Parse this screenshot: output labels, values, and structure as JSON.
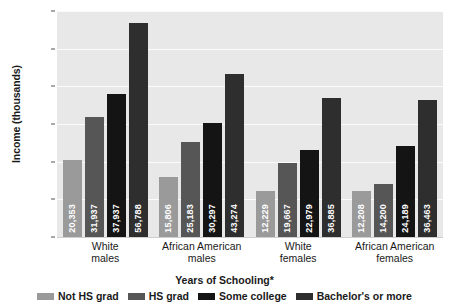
{
  "chart_data": {
    "type": "bar",
    "title": "",
    "xlabel": "Years of Schooling*",
    "ylabel": "Income (thousands)",
    "ylim": [
      0,
      60000
    ],
    "grid": true,
    "legend_position": "bottom",
    "categories": [
      "White\nmales",
      "African American\nmales",
      "White\nfemales",
      "African American\nfemales"
    ],
    "category_lines": [
      [
        "White",
        "males"
      ],
      [
        "African American",
        "males"
      ],
      [
        "White",
        "females"
      ],
      [
        "African American",
        "females"
      ]
    ],
    "ytick_labels": [
      "$60",
      "$50",
      "$40",
      "$30",
      "$20",
      "$10",
      "$0"
    ],
    "ytick_values": [
      60000,
      50000,
      40000,
      30000,
      20000,
      10000,
      0
    ],
    "series": [
      {
        "name": "Not HS grad",
        "color": "#9a9a9a",
        "values": [
          20353,
          15806,
          12229,
          12208
        ],
        "labels": [
          "20,353",
          "15,806",
          "12,229",
          "12,208"
        ]
      },
      {
        "name": "HS grad",
        "color": "#565656",
        "values": [
          31937,
          25183,
          19667,
          14200
        ],
        "labels": [
          "31,937",
          "25,183",
          "19,667",
          "14,200"
        ]
      },
      {
        "name": "Some college",
        "color": "#141414",
        "values": [
          37937,
          30297,
          22979,
          24189
        ],
        "labels": [
          "37,937",
          "30,297",
          "22,979",
          "24,189"
        ]
      },
      {
        "name": "Bachelor's or more",
        "color": "#2e2e2e",
        "values": [
          56788,
          43274,
          36885,
          36463
        ],
        "labels": [
          "56,788",
          "43,274",
          "36,885",
          "36,463"
        ]
      }
    ]
  },
  "colors": {
    "plot_background": "#e8e8e8",
    "gridline": "#fbfbfb",
    "page_background": "#ffffff",
    "text": "#1a1a1a"
  }
}
